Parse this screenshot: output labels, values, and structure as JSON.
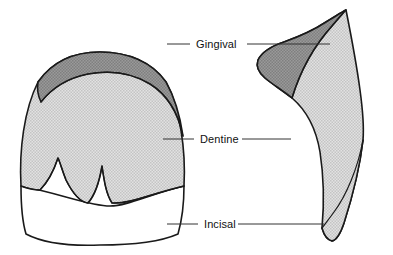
{
  "figure": {
    "background_color": "#ffffff",
    "outline_color": "#1a1a1a",
    "leader_color": "#333333"
  },
  "regions": {
    "gingival": {
      "name": "Gingival",
      "fill_color": "#8f8f8f",
      "description": "Dark grey band at the cervical / gingival third"
    },
    "dentine": {
      "name": "Dentine",
      "fill_color": "#d6d6d6",
      "description": "Light grey stippled body of the tooth"
    },
    "incisal": {
      "name": "Incisal",
      "fill_color": "#ffffff",
      "description": "White translucent incisal edge region"
    }
  },
  "labels": [
    {
      "id": "gingival",
      "text": "Gingival",
      "x": 196,
      "y": 48
    },
    {
      "id": "dentine",
      "text": "Dentine",
      "x": 200,
      "y": 140
    },
    {
      "id": "incisal",
      "text": "Incisal",
      "x": 204,
      "y": 227
    }
  ],
  "views": {
    "labial": {
      "name": "Labial view",
      "side": "left"
    },
    "proximal": {
      "name": "Proximal view",
      "side": "right"
    }
  }
}
